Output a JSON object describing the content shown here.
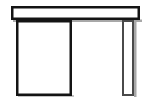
{
  "image": {
    "title": "Table line drawing",
    "width": 147,
    "height": 106,
    "background_color": "#ffffff",
    "stroke_color": "#141414",
    "shadow_color": "#9a9a9a",
    "description": "Simple black outline drawing of a table seen from the front: a horizontal tabletop bar across the top, a large rectangular panel or pedestal below the left side, and a narrow rectangular leg at the right."
  },
  "shapes": {
    "tabletop": {
      "name": "tabletop-bar",
      "kind": "rectangle-outline",
      "x": 11,
      "y": 6,
      "width": 129,
      "height": 14,
      "stroke_width": 2.5,
      "fill": "#ffffff"
    },
    "left_panel": {
      "name": "left-panel",
      "kind": "rectangle-outline",
      "x": 16,
      "y": 20,
      "width": 56,
      "height": 76,
      "stroke_width": 2.5,
      "fill": "#ffffff"
    },
    "right_leg": {
      "name": "right-leg",
      "kind": "rectangle-outline",
      "x": 122,
      "y": 20,
      "width": 12,
      "height": 76,
      "stroke_width": 2,
      "fill": "#ffffff"
    }
  },
  "shadows": {
    "tabletop_shadow": {
      "name": "tabletop-shadow",
      "x": 13,
      "y": 20,
      "width": 129,
      "height": 2
    },
    "right_leg_shadow": {
      "name": "right-leg-shadow",
      "x": 134,
      "y": 22,
      "width": 2,
      "height": 75
    }
  }
}
